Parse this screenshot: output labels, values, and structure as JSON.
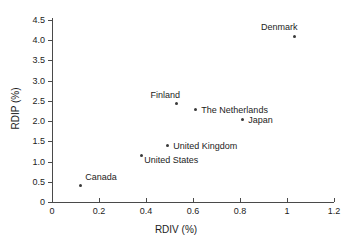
{
  "chart_data": {
    "type": "scatter",
    "title": "",
    "xlabel": "RDIV (%)",
    "ylabel": "RDIP (%)",
    "xlim": [
      0,
      1.2
    ],
    "ylim": [
      0,
      4.5
    ],
    "xticks": [
      "0",
      "0.2",
      "0.4",
      "0.6",
      "0.8",
      "1",
      "1.2"
    ],
    "xtick_values": [
      0,
      0.2,
      0.4,
      0.6,
      0.8,
      1.0,
      1.2
    ],
    "yticks": [
      "0",
      "0.5",
      "1.0",
      "1.5",
      "2.0",
      "2.5",
      "3.0",
      "3.5",
      "4.0",
      "4.5"
    ],
    "ytick_values": [
      0,
      0.5,
      1.0,
      1.5,
      2.0,
      2.5,
      3.0,
      3.5,
      4.0,
      4.5
    ],
    "grid": false,
    "legend": "none",
    "marker_color": "#3a3a3a",
    "axis_color": "#4a4a4a",
    "points": [
      {
        "label": "Denmark",
        "x": 1.03,
        "y": 4.1,
        "label_pos": "above-left"
      },
      {
        "label": "Finland",
        "x": 0.53,
        "y": 2.43,
        "label_pos": "above-left"
      },
      {
        "label": "The Netherlands",
        "x": 0.61,
        "y": 2.28,
        "label_pos": "right"
      },
      {
        "label": "Japan",
        "x": 0.81,
        "y": 2.03,
        "label_pos": "right"
      },
      {
        "label": "United Kingdom",
        "x": 0.49,
        "y": 1.39,
        "label_pos": "right"
      },
      {
        "label": "United States",
        "x": 0.38,
        "y": 1.16,
        "label_pos": "below-right"
      },
      {
        "label": "Canada",
        "x": 0.12,
        "y": 0.42,
        "label_pos": "above-right"
      }
    ]
  }
}
